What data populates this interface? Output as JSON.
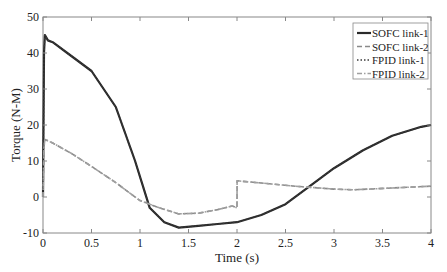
{
  "chart_data": {
    "type": "line",
    "title": "",
    "xlabel": "Time (s)",
    "ylabel": "Torque (N-M)",
    "xlim": [
      0,
      4
    ],
    "ylim": [
      -10,
      50
    ],
    "xticks": [
      0,
      0.5,
      1,
      1.5,
      2,
      2.5,
      3,
      3.5,
      4
    ],
    "xtick_labels": [
      "0",
      "0.5",
      "1",
      "1.5",
      "2",
      "2.5",
      "3",
      "3.5",
      "4"
    ],
    "yticks": [
      -10,
      0,
      10,
      20,
      30,
      40,
      50
    ],
    "ytick_labels": [
      "-10",
      "0",
      "10",
      "20",
      "30",
      "40",
      "50"
    ],
    "grid": false,
    "legend_position": "top-right",
    "series": [
      {
        "name": "SOFC link-1",
        "style": "solid",
        "color": "#2a2a2a",
        "x": [
          0,
          0.01,
          0.02,
          0.05,
          0.1,
          0.25,
          0.5,
          0.75,
          0.95,
          1.1,
          1.25,
          1.4,
          1.6,
          1.8,
          2.0,
          2.25,
          2.5,
          2.75,
          3.0,
          3.3,
          3.6,
          3.9,
          4.0
        ],
        "y": [
          0,
          40,
          45,
          43.5,
          43,
          40,
          35,
          25,
          10,
          -3,
          -7,
          -8.5,
          -8,
          -7.5,
          -7,
          -5,
          -2,
          3,
          8,
          13,
          17,
          19.5,
          20
        ]
      },
      {
        "name": "SOFC link-2",
        "style": "dashed",
        "color": "#8a8a8a",
        "x": [
          0,
          0.01,
          0.02,
          0.1,
          0.3,
          0.5,
          0.75,
          1.0,
          1.2,
          1.4,
          1.6,
          1.8,
          1.95,
          2.0,
          2.001,
          2.2,
          2.6,
          3.0,
          3.2,
          3.6,
          4.0
        ],
        "y": [
          0,
          14,
          16,
          15,
          12,
          8.5,
          4,
          -1,
          -3,
          -4.7,
          -4.5,
          -3.5,
          -2.5,
          -3,
          4.5,
          4,
          3,
          2.2,
          2,
          2.5,
          3
        ]
      },
      {
        "name": "FPID link-1",
        "style": "dotted",
        "color": "#3a3a3a",
        "x": [
          0,
          0.01,
          0.02,
          0.05,
          0.1,
          0.25,
          0.5,
          0.75,
          0.95,
          1.1,
          1.25,
          1.4,
          1.6,
          1.8,
          2.0,
          2.25,
          2.5,
          2.75,
          3.0,
          3.3,
          3.6,
          3.9,
          4.0
        ],
        "y": [
          0,
          40,
          45,
          43.5,
          43,
          40,
          35,
          25,
          10,
          -3,
          -7,
          -8.5,
          -8,
          -7.5,
          -7,
          -5,
          -2,
          3,
          8,
          13,
          17,
          19.5,
          20
        ]
      },
      {
        "name": "FPID link-2",
        "style": "dashdot",
        "color": "#a0a0a0",
        "x": [
          0,
          0.01,
          0.02,
          0.1,
          0.3,
          0.5,
          0.75,
          1.0,
          1.2,
          1.4,
          1.6,
          1.8,
          1.95,
          2.0,
          2.001,
          2.2,
          2.6,
          3.0,
          3.2,
          3.6,
          4.0
        ],
        "y": [
          0,
          14,
          16,
          15,
          12,
          8.5,
          4,
          -1,
          -3,
          -4.7,
          -4.5,
          -3.5,
          -2.5,
          -3,
          4.5,
          4,
          3,
          2.2,
          2,
          2.5,
          3
        ]
      }
    ]
  }
}
